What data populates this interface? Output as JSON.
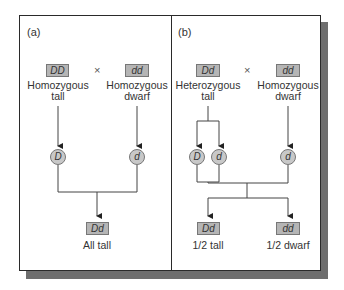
{
  "figure": {
    "colors": {
      "box_fill": "#b5b5b5",
      "gamete_fill": "#c8c8c8",
      "frame": "#2a2a2a",
      "shadow": "#6e6e6e"
    },
    "panel_a": {
      "label": "(a)",
      "cross_symbol": "×",
      "parent1": {
        "genotype": "DD",
        "description_line1": "Homozygous",
        "description_line2": "tall"
      },
      "parent2": {
        "genotype": "dd",
        "description_line1": "Homozygous",
        "description_line2": "dwarf"
      },
      "gametes": [
        "D",
        "d"
      ],
      "offspring": {
        "genotype": "Dd",
        "description": "All tall"
      }
    },
    "panel_b": {
      "label": "(b)",
      "cross_symbol": "×",
      "parent1": {
        "genotype": "Dd",
        "description_line1": "Heterozygous",
        "description_line2": "tall"
      },
      "parent2": {
        "genotype": "dd",
        "description_line1": "Homozygous",
        "description_line2": "dwarf"
      },
      "gametes": [
        "D",
        "d",
        "d"
      ],
      "offspring": [
        {
          "genotype": "Dd",
          "description": "1/2 tall"
        },
        {
          "genotype": "dd",
          "description": "1/2 dwarf"
        }
      ]
    }
  }
}
